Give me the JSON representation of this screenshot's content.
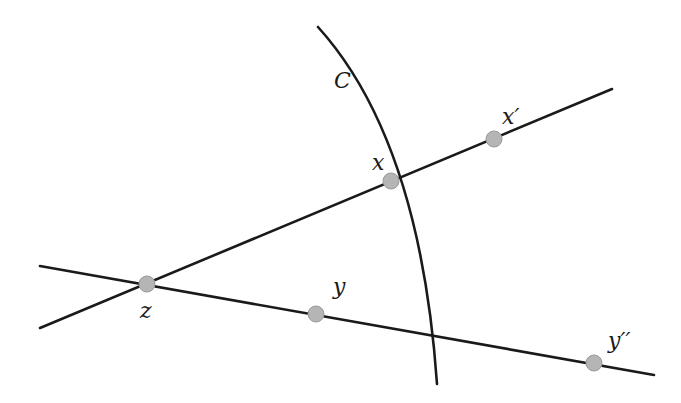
{
  "diagram": {
    "curve": {
      "label": "C",
      "label_pos": [
        334,
        88
      ],
      "path": "M318,27 Q420,140 437,384"
    },
    "lines": [
      {
        "name": "line-zx",
        "from": [
          40,
          328
        ],
        "to": [
          612,
          89
        ]
      },
      {
        "name": "line-zy",
        "from": [
          40,
          266
        ],
        "to": [
          654,
          375
        ]
      }
    ],
    "points": [
      {
        "id": "z",
        "label": "z",
        "pos": [
          147,
          284
        ],
        "label_pos": [
          140,
          318
        ]
      },
      {
        "id": "x",
        "label": "x",
        "pos": [
          391,
          181
        ],
        "label_pos": [
          372,
          170
        ]
      },
      {
        "id": "x_prime",
        "label": "x′",
        "pos": [
          494,
          139
        ],
        "label_pos": [
          502,
          124
        ]
      },
      {
        "id": "y",
        "label": "y",
        "pos": [
          316,
          314
        ],
        "label_pos": [
          333,
          294
        ]
      },
      {
        "id": "y_dprime",
        "label": "y′′",
        "pos": [
          594,
          363
        ],
        "label_pos": [
          608,
          348
        ]
      }
    ],
    "colors": {
      "stroke": "#1a1a1a",
      "point_fill": "#b5b5b5"
    }
  }
}
